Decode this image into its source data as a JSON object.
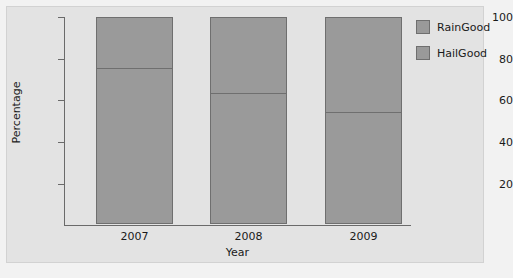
{
  "chart_data": {
    "type": "bar",
    "subtype": "stacked-bar",
    "title": "",
    "xlabel": "Year",
    "ylabel": "Percentage",
    "categories": [
      "2007",
      "2008",
      "2009"
    ],
    "series": [
      {
        "name": "HailGood",
        "values": [
          75,
          63,
          54
        ],
        "color": "#9a9a9a"
      },
      {
        "name": "RainGood",
        "values": [
          25,
          37,
          46
        ],
        "color": "#9a9a9a"
      }
    ],
    "stack_totals": [
      100,
      100,
      100
    ],
    "ylim": [
      0,
      100
    ],
    "yticks": [
      20,
      40,
      60,
      80,
      100
    ],
    "ytick_labels": [
      "20",
      "40",
      "60",
      "80",
      "100"
    ],
    "xtick_labels": [
      "2007",
      "2008",
      "2009"
    ],
    "grid": false,
    "legend_position": "right",
    "legend_entries": [
      "RainGood",
      "HailGood"
    ]
  },
  "axes": {
    "y_title": "Percentage",
    "x_title": "Year",
    "y_ticks": [
      {
        "label": "100",
        "value": 100
      },
      {
        "label": "80",
        "value": 80
      },
      {
        "label": "60",
        "value": 60
      },
      {
        "label": "40",
        "value": 40
      },
      {
        "label": "20",
        "value": 20
      }
    ],
    "x_ticks": [
      {
        "label": "2007"
      },
      {
        "label": "2008"
      },
      {
        "label": "2009"
      }
    ]
  },
  "legend": {
    "items": [
      {
        "label": "RainGood",
        "color": "#9a9a9a"
      },
      {
        "label": "HailGood",
        "color": "#9a9a9a"
      }
    ]
  },
  "colors": {
    "page_background": "#f2f2f2",
    "panel_background": "#e3e3e3",
    "bar_fill": "#9a9a9a",
    "bar_border": "#6f6f6f",
    "axis": "#6a6a6a",
    "text": "#1a1a1a"
  }
}
